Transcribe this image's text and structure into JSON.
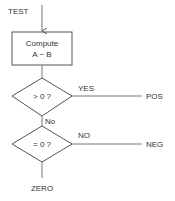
{
  "flowchart": {
    "entry_label": "TEST",
    "process": {
      "line1": "Compute",
      "line2": "A − B"
    },
    "decision1": {
      "text": "> 0 ?",
      "yes_label": "YES",
      "yes_target": "POS",
      "no_label": "No"
    },
    "decision2": {
      "text": "= 0 ?",
      "no_label": "NO",
      "no_target": "NEG",
      "yes_target": "ZERO"
    }
  }
}
